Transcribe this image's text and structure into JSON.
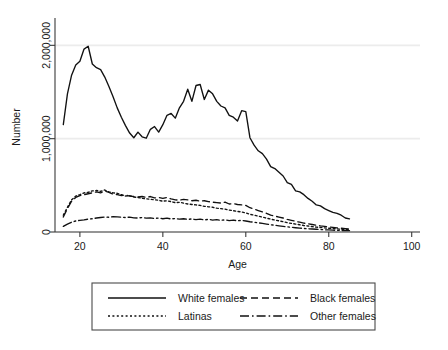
{
  "chart_data": {
    "type": "line",
    "title": "",
    "xlabel": "Age",
    "ylabel": "Number",
    "xlim": [
      14,
      102
    ],
    "ylim": [
      0,
      2250000
    ],
    "grid": "horizontal",
    "x_ticks": [
      20,
      40,
      60,
      80,
      100
    ],
    "x_tick_labels": [
      "20",
      "40",
      "60",
      "80",
      "100"
    ],
    "y_ticks": [
      0,
      1000000,
      2000000
    ],
    "y_tick_labels": [
      "0",
      "1,000,000",
      "2,000,000"
    ],
    "legend_position": "below-plot",
    "legend_entries": [
      {
        "label": "White females",
        "dash": "none"
      },
      {
        "label": "Black females",
        "dash": "dashed"
      },
      {
        "label": "Latinas",
        "dash": "dotted"
      },
      {
        "label": "Other females",
        "dash": "dash-dot"
      }
    ],
    "x": [
      16,
      17,
      18,
      19,
      20,
      21,
      22,
      23,
      24,
      25,
      26,
      27,
      28,
      29,
      30,
      31,
      32,
      33,
      34,
      35,
      36,
      37,
      38,
      39,
      40,
      41,
      42,
      43,
      44,
      45,
      46,
      47,
      48,
      49,
      50,
      51,
      52,
      53,
      54,
      55,
      56,
      57,
      58,
      59,
      60,
      61,
      62,
      63,
      64,
      65,
      66,
      67,
      68,
      69,
      70,
      71,
      72,
      73,
      74,
      75,
      76,
      77,
      78,
      79,
      80,
      81,
      82,
      83,
      84,
      85
    ],
    "series": [
      {
        "name": "White females",
        "dash": "none",
        "values": [
          1150000,
          1480000,
          1680000,
          1790000,
          1830000,
          1960000,
          1990000,
          1800000,
          1760000,
          1740000,
          1660000,
          1560000,
          1450000,
          1330000,
          1230000,
          1140000,
          1060000,
          1010000,
          1070000,
          1020000,
          1005000,
          1100000,
          1130000,
          1070000,
          1150000,
          1250000,
          1270000,
          1220000,
          1330000,
          1400000,
          1530000,
          1400000,
          1570000,
          1580000,
          1420000,
          1520000,
          1480000,
          1400000,
          1350000,
          1330000,
          1250000,
          1230000,
          1190000,
          1300000,
          1290000,
          1010000,
          930000,
          870000,
          840000,
          780000,
          700000,
          680000,
          640000,
          600000,
          530000,
          510000,
          440000,
          430000,
          400000,
          360000,
          330000,
          290000,
          280000,
          250000,
          230000,
          210000,
          200000,
          180000,
          150000,
          140000
        ]
      },
      {
        "name": "Black females",
        "dash": "dashed",
        "values": [
          160000,
          250000,
          330000,
          370000,
          390000,
          400000,
          410000,
          420000,
          430000,
          420000,
          440000,
          425000,
          405000,
          400000,
          390000,
          395000,
          385000,
          380000,
          375000,
          380000,
          370000,
          380000,
          365000,
          370000,
          360000,
          370000,
          355000,
          345000,
          340000,
          350000,
          345000,
          335000,
          340000,
          330000,
          335000,
          325000,
          320000,
          315000,
          310000,
          320000,
          300000,
          305000,
          295000,
          290000,
          285000,
          260000,
          245000,
          230000,
          215000,
          200000,
          180000,
          170000,
          160000,
          150000,
          135000,
          125000,
          115000,
          105000,
          95000,
          88000,
          80000,
          72000,
          65000,
          60000,
          55000,
          50000,
          45000,
          40000,
          36000,
          32000
        ]
      },
      {
        "name": "Latinas",
        "dash": "dotted",
        "values": [
          180000,
          265000,
          345000,
          385000,
          400000,
          420000,
          425000,
          440000,
          445000,
          435000,
          450000,
          430000,
          420000,
          415000,
          400000,
          385000,
          390000,
          375000,
          370000,
          360000,
          355000,
          350000,
          345000,
          340000,
          330000,
          335000,
          325000,
          315000,
          318000,
          310000,
          300000,
          295000,
          290000,
          285000,
          275000,
          270000,
          265000,
          255000,
          250000,
          245000,
          235000,
          228000,
          220000,
          215000,
          205000,
          190000,
          180000,
          170000,
          160000,
          148000,
          138000,
          128000,
          120000,
          110000,
          100000,
          92000,
          85000,
          78000,
          70000,
          64000,
          58000,
          52000,
          48000,
          44000,
          40000,
          36000,
          33000,
          30000,
          27000,
          24000
        ]
      },
      {
        "name": "Other females",
        "dash": "dash-dot",
        "values": [
          60000,
          85000,
          105000,
          118000,
          125000,
          130000,
          138000,
          142000,
          150000,
          155000,
          160000,
          158000,
          165000,
          162000,
          158000,
          155000,
          160000,
          152000,
          150000,
          155000,
          148000,
          152000,
          145000,
          150000,
          142000,
          148000,
          140000,
          145000,
          138000,
          142000,
          135000,
          140000,
          132000,
          138000,
          130000,
          135000,
          128000,
          132000,
          125000,
          130000,
          122000,
          128000,
          120000,
          125000,
          118000,
          110000,
          105000,
          98000,
          92000,
          85000,
          78000,
          72000,
          66000,
          60000,
          55000,
          50000,
          46000,
          42000,
          38000,
          35000,
          32000,
          29000,
          26000,
          24000,
          22000,
          20000,
          18000,
          16000,
          15000,
          14000
        ]
      }
    ]
  }
}
